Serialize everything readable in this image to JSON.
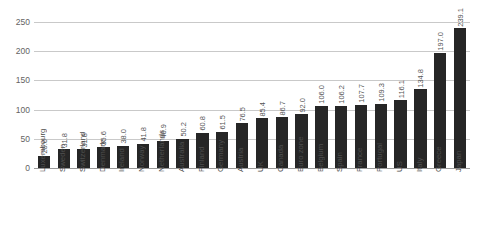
{
  "chart_data": {
    "type": "bar",
    "title": "",
    "subtitle": "",
    "xlabel": "",
    "ylabel": "",
    "ylim": [
      0,
      250
    ],
    "yticks": [
      0,
      50,
      100,
      150,
      200,
      250
    ],
    "grid": true,
    "legend": null,
    "bar_color": "#262626",
    "gridline_color": "#c9c9c9",
    "categories": [
      "Luxembourg",
      "Sweden",
      "Switzerland",
      "Denmark",
      "Ireland",
      "Norway",
      "Netherlands",
      "Australia",
      "Finland",
      "Germany",
      "Austria",
      "UK",
      "Canada",
      "Euro zone",
      "Belgium",
      "Spain",
      "France",
      "Portugal",
      "US",
      "Italy",
      "Greece",
      "Japan"
    ],
    "values": [
      20.6,
      31.8,
      31.8,
      35.6,
      38.0,
      41.8,
      46.9,
      50.2,
      60.8,
      61.5,
      76.5,
      85.4,
      86.7,
      92.0,
      106.0,
      106.2,
      107.7,
      109.3,
      116.1,
      134.8,
      197.0,
      239.1
    ],
    "value_labels": [
      "20.6",
      "31.8",
      "31.8",
      "35.6",
      "38.0",
      "41.8",
      "46.9",
      "50.2",
      "60.8",
      "61.5",
      "76.5",
      "85.4",
      "86.7",
      "92.0",
      "106.0",
      "106.2",
      "107.7",
      "109.3",
      "116.1",
      "134.8",
      "197.0",
      "239.1"
    ],
    "ytick_labels": [
      "0",
      "50",
      "100",
      "150",
      "200",
      "250"
    ]
  }
}
